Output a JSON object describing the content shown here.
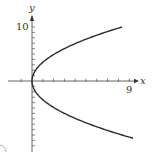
{
  "chart_data": {
    "type": "line",
    "title": "",
    "xlabel": "x",
    "ylabel": "y",
    "equation_shape": "sideways parabola opening right, vertex at origin (x = y^2 / 12 approx)",
    "series": [
      {
        "name": "parabola",
        "points": [
          {
            "x": 8.33,
            "y": 10
          },
          {
            "x": 6.75,
            "y": 9
          },
          {
            "x": 5.33,
            "y": 8
          },
          {
            "x": 4.08,
            "y": 7
          },
          {
            "x": 3.0,
            "y": 6
          },
          {
            "x": 2.08,
            "y": 5
          },
          {
            "x": 1.33,
            "y": 4
          },
          {
            "x": 0.75,
            "y": 3
          },
          {
            "x": 0.33,
            "y": 2
          },
          {
            "x": 0.08,
            "y": 1
          },
          {
            "x": 0,
            "y": 0
          },
          {
            "x": 0.08,
            "y": -1
          },
          {
            "x": 0.33,
            "y": -2
          },
          {
            "x": 0.75,
            "y": -3
          },
          {
            "x": 1.33,
            "y": -4
          },
          {
            "x": 2.08,
            "y": -5
          },
          {
            "x": 3.0,
            "y": -6
          },
          {
            "x": 4.08,
            "y": -7
          },
          {
            "x": 5.33,
            "y": -8
          },
          {
            "x": 6.75,
            "y": -9
          },
          {
            "x": 8.33,
            "y": -10
          }
        ]
      }
    ],
    "x_tick_labels": [
      {
        "value": 9,
        "label": "9"
      }
    ],
    "y_tick_labels": [
      {
        "value": 10,
        "label": "10"
      }
    ],
    "xlim": [
      -1,
      10
    ],
    "ylim": [
      -12,
      11
    ],
    "x_ticks_every": 1,
    "y_ticks_every": 1,
    "grid": false,
    "legend": "none"
  },
  "labels": {
    "x_axis": "x",
    "y_axis": "y",
    "x_tick": "9",
    "y_tick": "10"
  }
}
